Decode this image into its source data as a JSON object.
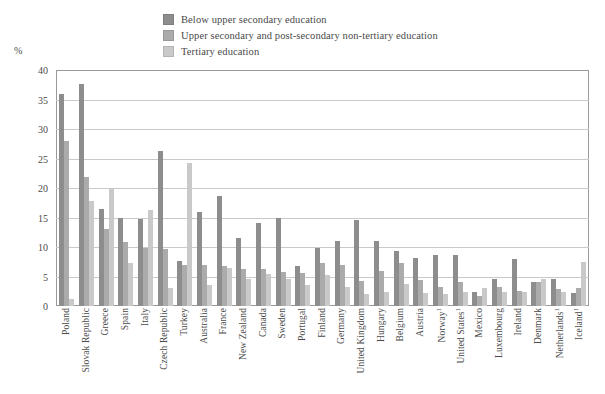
{
  "legend": {
    "position": "top-center",
    "items": [
      {
        "label": "Below upper secondary education",
        "color": "#8d8d8d",
        "icon": "legend-swatch-icon"
      },
      {
        "label": "Upper secondary and post-secondary non-tertiary education",
        "color": "#ababab",
        "icon": "legend-swatch-icon"
      },
      {
        "label": "Tertiary education",
        "color": "#c9c9c9",
        "icon": "legend-swatch-icon"
      }
    ]
  },
  "axes": {
    "y_unit": "%",
    "y_ticks": [
      "40",
      "35",
      "30",
      "25",
      "20",
      "15",
      "10",
      "5",
      "0"
    ]
  },
  "chart_data": {
    "type": "bar",
    "title": "",
    "subtitle": "",
    "xlabel": "",
    "ylabel": "%",
    "ylim": [
      0,
      40
    ],
    "ytick_step": 5,
    "grid": true,
    "legend_position": "top-center",
    "categories": [
      "Poland",
      "Slovak Republic",
      "Greece",
      "Spain",
      "Italy",
      "Czech Republic",
      "Turkey",
      "Australia",
      "France",
      "New Zealand",
      "Canada",
      "Sweden",
      "Portugal",
      "Finland",
      "Germany",
      "United Kingdom",
      "Hungary",
      "Belgium",
      "Austria",
      "Norway¹",
      "United States¹",
      "Mexico",
      "Luxembourg",
      "Ireland",
      "Denmark",
      "Netherlands¹",
      "Iceland¹"
    ],
    "category_notes": {
      "Norway¹": "1",
      "United States¹": "1",
      "Netherlands¹": "1",
      "Iceland¹": "1"
    },
    "series": [
      {
        "name": "Below upper secondary education",
        "color": "#8d8d8d",
        "values": [
          36.0,
          37.7,
          16.5,
          15.0,
          14.8,
          26.3,
          7.6,
          16.0,
          18.7,
          11.5,
          14.0,
          15.0,
          6.7,
          9.8,
          11.0,
          14.6,
          11.0,
          9.3,
          8.2,
          8.7,
          8.7,
          2.4,
          4.6,
          8.0,
          4.1,
          4.6,
          2.2
        ],
        "unit": "%"
      },
      {
        "name": "Upper secondary and post-secondary non-tertiary education",
        "color": "#ababab",
        "values": [
          28.0,
          21.8,
          13.1,
          10.8,
          9.8,
          9.7,
          7.0,
          7.0,
          6.8,
          6.3,
          6.3,
          5.7,
          5.6,
          7.3,
          6.9,
          4.3,
          6.0,
          7.3,
          4.4,
          3.3,
          4.1,
          1.7,
          3.2,
          2.5,
          4.1,
          2.9,
          3.1
        ],
        "unit": "%"
      },
      {
        "name": "Tertiary education",
        "color": "#c9c9c9",
        "values": [
          1.2,
          17.8,
          20.0,
          7.3,
          16.3,
          3.0,
          24.2,
          3.6,
          6.4,
          4.5,
          5.5,
          4.6,
          3.5,
          5.3,
          3.2,
          2.1,
          2.3,
          3.7,
          2.2,
          2.1,
          2.3,
          3.0,
          2.3,
          2.3,
          4.5,
          2.4,
          7.5
        ],
        "unit": "%"
      }
    ]
  }
}
